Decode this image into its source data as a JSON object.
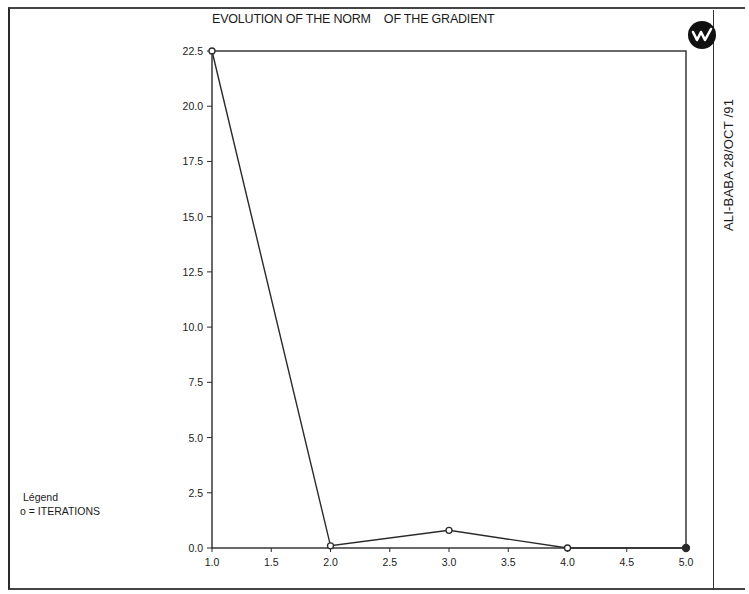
{
  "header": {
    "title": "EVOLUTION OF THE NORM    OF THE GRADIENT",
    "side_label": "ALI-BABA 28/OCT /91",
    "logo_icon": "w-logo-icon"
  },
  "legend": {
    "title": "Légend",
    "entry": "o = ITERATIONS"
  },
  "colors": {
    "line": "#2a2a2a",
    "background": "#ffffff",
    "text": "#1a1a1a"
  },
  "chart_data": {
    "type": "line",
    "title": "EVOLUTION OF THE NORM OF THE GRADIENT",
    "xlabel": "",
    "ylabel": "",
    "x": [
      1.0,
      2.0,
      3.0,
      4.0,
      5.0
    ],
    "series": [
      {
        "name": "ITERATIONS",
        "marker": "o",
        "values": [
          22.5,
          0.1,
          0.8,
          0.0,
          0.0
        ]
      }
    ],
    "xlim": [
      1.0,
      5.0
    ],
    "ylim": [
      0.0,
      22.5
    ],
    "x_ticks": [
      "1.0",
      "1.5",
      "2.0",
      "2.5",
      "3.0",
      "3.5",
      "4.0",
      "4.5",
      "5.0"
    ],
    "y_ticks": [
      "0.0",
      "2.5",
      "5.0",
      "7.5",
      "10.0",
      "12.5",
      "15.0",
      "17.5",
      "20.0",
      "22.5"
    ],
    "grid": false,
    "legend_position": "bottom-left outside",
    "annotations": [
      "ALI-BABA 28/OCT /91"
    ]
  }
}
